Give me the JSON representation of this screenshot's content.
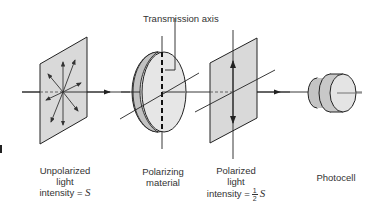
{
  "diagram": {
    "callout": {
      "label": "Transmission axis"
    },
    "components": [
      {
        "id": "unpolarized",
        "label_lines": [
          "Unpolarized",
          "light"
        ],
        "intensity_prefix": "intensity =",
        "intensity_value": "S"
      },
      {
        "id": "polarizer",
        "label_lines": [
          "Polarizing",
          "material"
        ]
      },
      {
        "id": "polarized",
        "label_lines": [
          "Polarized",
          "light"
        ],
        "intensity_prefix": "intensity =",
        "fraction_num": "1",
        "fraction_den": "2",
        "intensity_value": "S"
      },
      {
        "id": "photocell",
        "label_lines": [
          "Photocell"
        ]
      }
    ],
    "colors": {
      "panel_fill": "#d9d9d9",
      "disc_face": "#e4e4e4",
      "disc_edge": "#c2c2c2",
      "stroke": "#222222"
    }
  }
}
